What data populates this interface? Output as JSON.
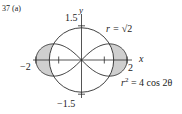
{
  "figure": {
    "problem_label": "37 (a)",
    "axis_x_label": "x",
    "axis_y_label": "y",
    "tick_y_top": "1.5",
    "tick_y_bottom": "−1.5",
    "tick_x_left": "−2",
    "tick_x_right": "2",
    "circle_label": "r = √2",
    "circle_label_lhs": "r = ",
    "circle_label_rhs": "√2",
    "lemniscate_label_lhs": "r",
    "lemniscate_label_sup": "2",
    "lemniscate_label_rhs": " = 4 cos 2θ",
    "colors": {
      "stroke": "#2a2a2a",
      "shade": "#cfcfcf",
      "background": "#ffffff"
    }
  },
  "chart_data": {
    "type": "polar-curves",
    "title": "37 (a)",
    "curves": [
      {
        "name": "circle",
        "equation": "r = √2",
        "radius": 1.4142
      },
      {
        "name": "lemniscate",
        "equation": "r^2 = 4 cos 2θ",
        "max_r": 2
      }
    ],
    "shaded_regions": "Inside lemniscate and outside circle (two lobes near x = ±2)",
    "intersections_theta": [
      "±π/6",
      "π ± π/6"
    ],
    "xlabel": "x",
    "ylabel": "y",
    "x_ticks": [
      -2,
      -1,
      1,
      2
    ],
    "x_tick_labels": [
      "−2",
      "2"
    ],
    "y_ticks": [
      -1.5,
      1.5
    ],
    "y_tick_labels": [
      "−1.5",
      "1.5"
    ],
    "xlim": [
      -2.1,
      2.1
    ],
    "ylim": [
      -1.6,
      1.6
    ],
    "grid": false
  }
}
